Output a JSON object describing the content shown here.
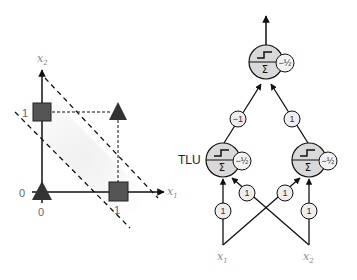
{
  "left_plot": {
    "x_axis_label": "x",
    "x_axis_sub": "1",
    "y_axis_label": "x",
    "y_axis_sub": "2",
    "tick_x0": "0",
    "tick_x1": "1",
    "tick_y0": "0",
    "tick_y1": "1",
    "points": [
      {
        "x": 0,
        "y": 0,
        "shape": "triangle",
        "class": "0"
      },
      {
        "x": 1,
        "y": 1,
        "shape": "triangle",
        "class": "0"
      },
      {
        "x": 0,
        "y": 1,
        "shape": "square",
        "class": "1"
      },
      {
        "x": 1,
        "y": 0,
        "shape": "square",
        "class": "1"
      }
    ],
    "colors": {
      "marker": "#555555",
      "axis": "#111111",
      "shade": "#f2f2f2"
    }
  },
  "network": {
    "tlu_label": "TLU",
    "output_neuron": {
      "bias": "−½",
      "sum_symbol": "Σ"
    },
    "hidden_left": {
      "bias": "−½",
      "sum_symbol": "Σ"
    },
    "hidden_right": {
      "bias": "−½",
      "sum_symbol": "Σ"
    },
    "weights": {
      "left_to_output": "−1",
      "right_to_output": "1",
      "x1_to_left": "1",
      "x2_to_left": "1",
      "x1_to_right": "1",
      "x2_to_right": "1"
    },
    "inputs": [
      {
        "label": "x",
        "sub": "1"
      },
      {
        "label": "x",
        "sub": "2"
      }
    ],
    "colors": {
      "neuron_fill": "#d9d9d9",
      "weight_fill": "#eeeeee",
      "stroke": "#111111"
    }
  }
}
